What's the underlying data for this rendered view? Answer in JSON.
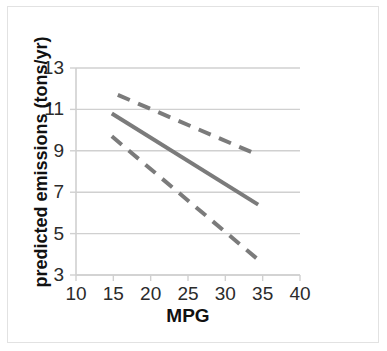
{
  "figure": {
    "border_color": "#e2e2e2",
    "background": "#ffffff"
  },
  "chart_data": {
    "type": "line",
    "title": "",
    "xlabel": "MPG",
    "ylabel": "predicted emissions (tons/yr)",
    "xlim": [
      10,
      40
    ],
    "ylim": [
      3,
      13
    ],
    "xticks": [
      10,
      15,
      20,
      25,
      30,
      35,
      40
    ],
    "yticks": [
      3,
      5,
      7,
      9,
      11,
      13
    ],
    "xtick_labels": [
      "10",
      "15",
      "20",
      "25",
      "30",
      "35",
      "40"
    ],
    "ytick_labels": [
      "3",
      "5",
      "7",
      "9",
      "11",
      "13"
    ],
    "grid": "horizontal",
    "grid_color": "#d0d0d0",
    "legend": "none",
    "line_color": "#7b7b7b",
    "series": [
      {
        "name": "predicted emissions",
        "style": "solid",
        "color": "#7b7b7b",
        "width": 4,
        "x": [
          14.8,
          34.4
        ],
        "y": [
          10.8,
          6.4
        ]
      },
      {
        "name": "upper confidence limit",
        "style": "dashed",
        "color": "#7b7b7b",
        "width": 4,
        "x": [
          15.6,
          34.4
        ],
        "y": [
          11.7,
          8.8
        ]
      },
      {
        "name": "lower confidence limit",
        "style": "dashed",
        "color": "#7b7b7b",
        "width": 4,
        "x": [
          14.8,
          34.2
        ],
        "y": [
          9.7,
          3.8
        ]
      }
    ]
  }
}
